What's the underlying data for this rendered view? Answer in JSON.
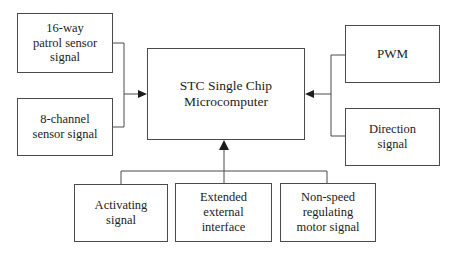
{
  "diagram": {
    "type": "block-diagram",
    "background_color": "#ffffff",
    "line_color": "#4a4a4a",
    "text_color": "#1c1c1c",
    "nodes": [
      {
        "id": "patrol",
        "label": "16-way\npatrol sensor\nsignal",
        "role": "input-source",
        "position": "top-left"
      },
      {
        "id": "channel",
        "label": "8-channel\nsensor signal",
        "role": "input-source",
        "position": "bottom-left"
      },
      {
        "id": "mcu",
        "label": "STC Single Chip\nMicrocomputer",
        "role": "controller",
        "position": "center"
      },
      {
        "id": "pwm",
        "label": "PWM",
        "role": "input-source",
        "position": "top-right"
      },
      {
        "id": "direction",
        "label": "Direction\nsignal",
        "role": "input-source",
        "position": "bottom-right"
      },
      {
        "id": "activating",
        "label": "Activating\nsignal",
        "role": "input-source",
        "position": "bottom-left"
      },
      {
        "id": "extended",
        "label": "Extended\nexternal\ninterface",
        "role": "input-source",
        "position": "bottom-center"
      },
      {
        "id": "nonspeed",
        "label": "Non-speed\nregulating\nmotor signal",
        "role": "input-source",
        "position": "bottom-right"
      }
    ],
    "connections": [
      {
        "id": "left-bus",
        "from": [
          "patrol",
          "channel"
        ],
        "to": "mcu",
        "arrow": "right"
      },
      {
        "id": "right-bus",
        "from": [
          "pwm",
          "direction"
        ],
        "to": "mcu",
        "arrow": "left"
      },
      {
        "id": "bottom-bus",
        "from": [
          "activating",
          "extended",
          "nonspeed"
        ],
        "to": "mcu",
        "arrow": "up"
      }
    ]
  }
}
